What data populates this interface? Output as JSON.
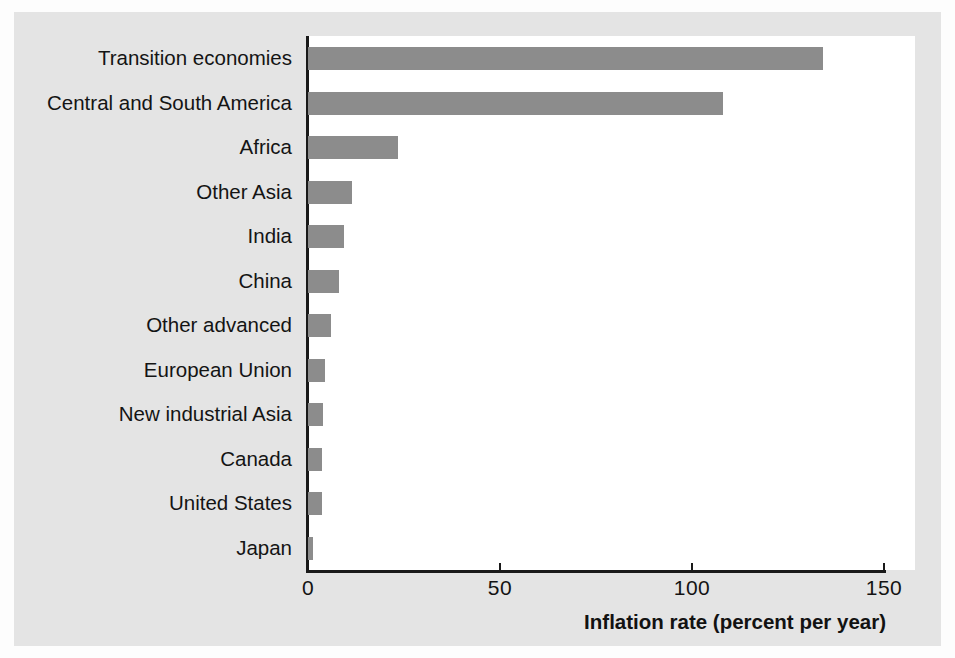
{
  "chart_data": {
    "type": "bar",
    "orientation": "horizontal",
    "title": "",
    "xlabel": "Inflation rate (percent per year)",
    "ylabel": "",
    "xlim": [
      0,
      160
    ],
    "xticks": [
      0,
      50,
      100,
      150
    ],
    "xtick_labels": [
      "0",
      "50",
      "100",
      "150"
    ],
    "grid": false,
    "legend": false,
    "bar_color": "#8c8c8c",
    "axis_color": "#1a1a1a",
    "text_color": "#141414",
    "panel_color": "#ffffff",
    "background_color": "#e4e4e4",
    "categories": [
      "Transition economies",
      "Central and South America",
      "Africa",
      "Other Asia",
      "India",
      "China",
      "Other advanced",
      "European Union",
      "New industrial Asia",
      "Canada",
      "United States",
      "Japan"
    ],
    "values": [
      134,
      108,
      23.5,
      11.5,
      9.5,
      8,
      6,
      4.3,
      4,
      3.7,
      3.6,
      1.3
    ]
  },
  "axis": {
    "x_title": "Inflation rate (percent per year)",
    "ticks": [
      "0",
      "50",
      "100",
      "150"
    ]
  }
}
